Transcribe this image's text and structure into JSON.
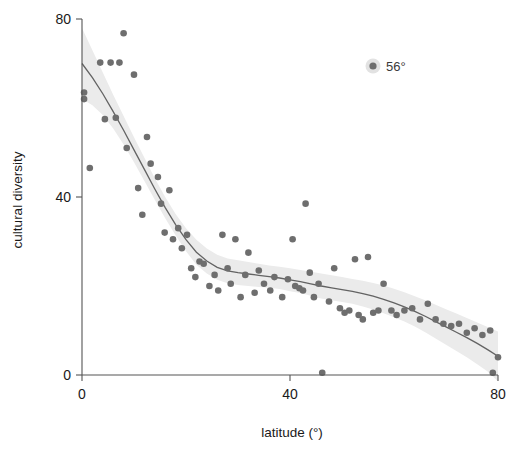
{
  "chart_data": {
    "type": "scatter",
    "title": "",
    "xlabel": "latitude (°)",
    "ylabel": "cultural diversity",
    "xlim": [
      0,
      80
    ],
    "ylim": [
      0,
      80
    ],
    "xticks": [
      0,
      40,
      80
    ],
    "xtick_labels": [
      "0",
      "40",
      "80"
    ],
    "yticks": [
      0,
      40,
      80
    ],
    "ytick_labels": [
      "0",
      "40",
      "80"
    ],
    "grid": false,
    "legend_position": "top-right",
    "annotation": {
      "label": "56°",
      "marker": "target-dot",
      "x_px": 373,
      "y_px": 66
    },
    "colors": {
      "point": "#6e6e6e",
      "trend_line": "#636363",
      "confidence_band": "#ebebeb",
      "axis": "#555555",
      "text": "#1a1a1a"
    },
    "series": [
      {
        "name": "observations",
        "marker": "circle",
        "points": [
          [
            0.4,
            63.5
          ],
          [
            0.4,
            62.0
          ],
          [
            1.5,
            46.5
          ],
          [
            3.5,
            70.2
          ],
          [
            4.4,
            57.5
          ],
          [
            5.5,
            70.2
          ],
          [
            6.5,
            57.8
          ],
          [
            7.2,
            70.2
          ],
          [
            8.0,
            76.8
          ],
          [
            8.6,
            51.0
          ],
          [
            10.0,
            67.5
          ],
          [
            10.8,
            42.0
          ],
          [
            11.6,
            36.0
          ],
          [
            12.5,
            53.5
          ],
          [
            13.2,
            47.5
          ],
          [
            14.6,
            44.5
          ],
          [
            15.2,
            38.5
          ],
          [
            15.9,
            32.0
          ],
          [
            16.8,
            41.5
          ],
          [
            17.5,
            30.5
          ],
          [
            18.5,
            33.0
          ],
          [
            19.2,
            28.5
          ],
          [
            20.2,
            31.5
          ],
          [
            21.0,
            24.0
          ],
          [
            21.8,
            22.0
          ],
          [
            22.6,
            25.5
          ],
          [
            23.4,
            25.0
          ],
          [
            24.5,
            20.0
          ],
          [
            25.5,
            22.5
          ],
          [
            26.2,
            19.0
          ],
          [
            27.0,
            31.5
          ],
          [
            28.0,
            24.0
          ],
          [
            28.6,
            20.5
          ],
          [
            29.5,
            30.5
          ],
          [
            30.5,
            17.5
          ],
          [
            31.4,
            22.5
          ],
          [
            32.0,
            27.5
          ],
          [
            33.2,
            18.5
          ],
          [
            34.0,
            23.5
          ],
          [
            35.0,
            20.5
          ],
          [
            36.2,
            19.0
          ],
          [
            37.0,
            22.0
          ],
          [
            38.5,
            17.5
          ],
          [
            39.6,
            21.5
          ],
          [
            40.5,
            30.5
          ],
          [
            41.0,
            20.0
          ],
          [
            41.8,
            19.5
          ],
          [
            42.5,
            19.0
          ],
          [
            43.0,
            38.5
          ],
          [
            43.8,
            23.0
          ],
          [
            44.6,
            17.5
          ],
          [
            45.5,
            20.5
          ],
          [
            46.2,
            0.5
          ],
          [
            47.5,
            16.5
          ],
          [
            48.5,
            24.0
          ],
          [
            49.6,
            15.0
          ],
          [
            50.5,
            14.0
          ],
          [
            51.4,
            14.5
          ],
          [
            52.5,
            26.0
          ],
          [
            53.2,
            13.5
          ],
          [
            54.0,
            12.5
          ],
          [
            55.0,
            26.5
          ],
          [
            56.0,
            14.0
          ],
          [
            57.0,
            14.5
          ],
          [
            58.0,
            20.5
          ],
          [
            59.5,
            14.5
          ],
          [
            60.5,
            13.5
          ],
          [
            62.0,
            14.5
          ],
          [
            63.5,
            15.0
          ],
          [
            65.0,
            12.5
          ],
          [
            66.5,
            16.0
          ],
          [
            68.0,
            12.5
          ],
          [
            69.5,
            11.5
          ],
          [
            71.0,
            11.0
          ],
          [
            72.5,
            11.5
          ],
          [
            74.0,
            9.5
          ],
          [
            75.5,
            10.5
          ],
          [
            77.0,
            9.0
          ],
          [
            78.5,
            10.0
          ],
          [
            79.0,
            0.5
          ],
          [
            80.0,
            4.0
          ]
        ]
      }
    ],
    "trend": {
      "name": "loess smooth",
      "points": [
        [
          0,
          70.0
        ],
        [
          2,
          66.8
        ],
        [
          4,
          63.2
        ],
        [
          6,
          59.2
        ],
        [
          8,
          55.0
        ],
        [
          10,
          50.6
        ],
        [
          12,
          46.2
        ],
        [
          14,
          41.8
        ],
        [
          16,
          37.6
        ],
        [
          18,
          33.8
        ],
        [
          20,
          30.4
        ],
        [
          22,
          27.6
        ],
        [
          24,
          25.6
        ],
        [
          26,
          24.2
        ],
        [
          28,
          23.4
        ],
        [
          30,
          23.0
        ],
        [
          32,
          22.7
        ],
        [
          34,
          22.4
        ],
        [
          36,
          22.1
        ],
        [
          38,
          21.8
        ],
        [
          40,
          21.4
        ],
        [
          42,
          21.0
        ],
        [
          44,
          20.5
        ],
        [
          46,
          20.0
        ],
        [
          48,
          19.6
        ],
        [
          50,
          19.2
        ],
        [
          52,
          18.8
        ],
        [
          54,
          18.3
        ],
        [
          56,
          17.7
        ],
        [
          58,
          17.0
        ],
        [
          60,
          16.2
        ],
        [
          62,
          15.3
        ],
        [
          64,
          14.3
        ],
        [
          66,
          13.2
        ],
        [
          68,
          12.0
        ],
        [
          70,
          10.8
        ],
        [
          72,
          9.6
        ],
        [
          74,
          8.4
        ],
        [
          76,
          7.1
        ],
        [
          78,
          5.7
        ],
        [
          80,
          4.2
        ]
      ],
      "band_upper": [
        [
          0,
          78.0
        ],
        [
          2,
          73.0
        ],
        [
          4,
          68.0
        ],
        [
          6,
          63.0
        ],
        [
          8,
          58.2
        ],
        [
          10,
          53.4
        ],
        [
          12,
          48.8
        ],
        [
          14,
          44.2
        ],
        [
          16,
          40.0
        ],
        [
          18,
          36.2
        ],
        [
          20,
          33.0
        ],
        [
          22,
          30.4
        ],
        [
          24,
          28.4
        ],
        [
          26,
          27.0
        ],
        [
          28,
          26.2
        ],
        [
          30,
          25.8
        ],
        [
          32,
          25.4
        ],
        [
          34,
          25.0
        ],
        [
          36,
          24.6
        ],
        [
          38,
          24.3
        ],
        [
          40,
          24.0
        ],
        [
          42,
          23.6
        ],
        [
          44,
          23.2
        ],
        [
          46,
          22.8
        ],
        [
          48,
          22.4
        ],
        [
          50,
          22.0
        ],
        [
          52,
          21.6
        ],
        [
          54,
          21.2
        ],
        [
          56,
          20.7
        ],
        [
          58,
          20.1
        ],
        [
          60,
          19.4
        ],
        [
          62,
          18.6
        ],
        [
          64,
          17.7
        ],
        [
          66,
          16.8
        ],
        [
          68,
          15.8
        ],
        [
          70,
          14.8
        ],
        [
          72,
          13.8
        ],
        [
          74,
          12.8
        ],
        [
          76,
          11.8
        ],
        [
          78,
          10.8
        ],
        [
          80,
          9.8
        ]
      ],
      "band_lower": [
        [
          0,
          62.0
        ],
        [
          2,
          60.6
        ],
        [
          4,
          58.4
        ],
        [
          6,
          55.4
        ],
        [
          8,
          51.8
        ],
        [
          10,
          47.8
        ],
        [
          12,
          43.6
        ],
        [
          14,
          39.4
        ],
        [
          16,
          35.2
        ],
        [
          18,
          31.4
        ],
        [
          20,
          27.8
        ],
        [
          22,
          24.8
        ],
        [
          24,
          22.8
        ],
        [
          26,
          21.4
        ],
        [
          28,
          20.6
        ],
        [
          30,
          20.2
        ],
        [
          32,
          20.0
        ],
        [
          34,
          19.8
        ],
        [
          36,
          19.6
        ],
        [
          38,
          19.3
        ],
        [
          40,
          18.8
        ],
        [
          42,
          18.4
        ],
        [
          44,
          17.8
        ],
        [
          46,
          17.2
        ],
        [
          48,
          16.8
        ],
        [
          50,
          16.4
        ],
        [
          52,
          16.0
        ],
        [
          54,
          15.4
        ],
        [
          56,
          14.7
        ],
        [
          58,
          13.9
        ],
        [
          60,
          13.0
        ],
        [
          62,
          12.0
        ],
        [
          64,
          10.9
        ],
        [
          66,
          9.6
        ],
        [
          68,
          8.2
        ],
        [
          70,
          6.8
        ],
        [
          72,
          5.4
        ],
        [
          74,
          4.0
        ],
        [
          76,
          2.4
        ],
        [
          78,
          0.8
        ],
        [
          80,
          -1.4
        ]
      ]
    }
  }
}
